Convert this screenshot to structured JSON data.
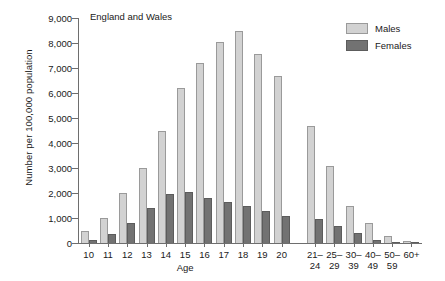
{
  "chart_data": {
    "type": "bar",
    "title": "England and Wales",
    "xlabel": "Age",
    "ylabel": "Number per 100,000 population",
    "ylim": [
      0,
      9000
    ],
    "yticks": [
      0,
      1000,
      2000,
      3000,
      4000,
      5000,
      6000,
      7000,
      8000,
      9000
    ],
    "ytick_labels": [
      "0",
      "1,000",
      "2,000",
      "3,000",
      "4,000",
      "5,000",
      "6,000",
      "7,000",
      "8,000",
      "9,000"
    ],
    "grid": false,
    "legend_position": "top-right",
    "categories": [
      "10",
      "11",
      "12",
      "13",
      "14",
      "15",
      "16",
      "17",
      "18",
      "19",
      "20",
      "21–\n24",
      "25–\n29",
      "30–\n39",
      "40–\n49",
      "50–\n59",
      "60+"
    ],
    "group_break_after_index": 10,
    "series": [
      {
        "name": "Males",
        "color": "#d2d2d2",
        "values": [
          500,
          1000,
          2000,
          3000,
          4500,
          6200,
          7200,
          8050,
          8500,
          7550,
          6700,
          4700,
          3100,
          1500,
          800,
          300,
          100
        ]
      },
      {
        "name": "Females",
        "color": "#727272",
        "values": [
          130,
          380,
          800,
          1400,
          1950,
          2050,
          1800,
          1650,
          1500,
          1300,
          1100,
          980,
          700,
          420,
          130,
          60,
          40
        ]
      }
    ]
  },
  "legend": {
    "items": [
      {
        "label": "Males",
        "swatch": "males-swatch"
      },
      {
        "label": "Females",
        "swatch": "females-swatch"
      }
    ]
  }
}
